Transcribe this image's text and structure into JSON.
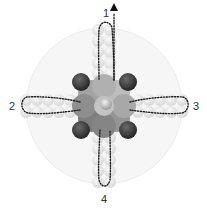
{
  "figure": {
    "labels": [
      {
        "id": "1",
        "text": "1",
        "position": "top"
      },
      {
        "id": "2",
        "text": "2",
        "position": "left"
      },
      {
        "id": "3",
        "text": "3",
        "position": "right"
      },
      {
        "id": "4",
        "text": "4",
        "position": "bottom"
      }
    ],
    "arrow": {
      "direction": "up",
      "near_label": "1"
    },
    "colors": {
      "background_disc": "#f4f4f4",
      "arm_spheres": "#e2e2e2",
      "core_light": "#b5b5b5",
      "core_mid": "#8f8f8f",
      "core_dark": "#6e6e6e",
      "corner_spheres": "#3c3c3c",
      "path": "#222222"
    }
  }
}
